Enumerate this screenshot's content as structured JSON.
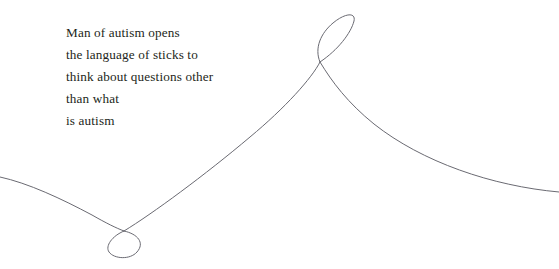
{
  "artwork": {
    "title": "Man of autism opens",
    "background_color": "#ffffff",
    "width": 559,
    "height": 269
  },
  "poem": {
    "lines": [
      "Man of autism opens",
      "the language of sticks to",
      "think about questions other",
      "than what",
      "is autism"
    ],
    "text_color": "#231f20"
  },
  "drawing": {
    "stroke_color": "#6a6a72",
    "stroke_width": 1,
    "description": "single continuous looping line",
    "paths": {
      "main_line": "M 0,177 C 28,183 62,199 92,215 C 106,223 116,228 124,231",
      "lower_loop": "M 124,231 C 112,236 106,246 110,252 C 115,259 130,259 137,252 C 144,244 138,234 124,231",
      "diagonal": "M 124,231 C 160,208 240,146 286,104 C 302,89 314,72 320,62",
      "upper_loop": "M 320,62 C 316,50 322,34 334,24 C 346,14 355,13 354,21 C 353,32 338,50 320,62",
      "right_tail": "M 320,62 C 330,80 346,101 372,122 C 420,160 490,186 559,192"
    }
  }
}
